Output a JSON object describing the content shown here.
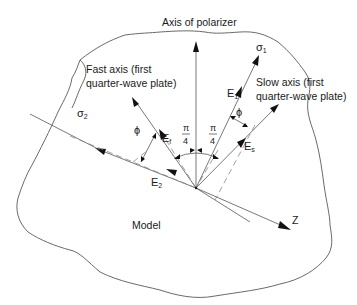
{
  "diagram": {
    "labels": {
      "polarizer_axis": "Axis of polarizer",
      "fast_axis_line1": "Fast axis (first",
      "fast_axis_line2": "quarter-wave plate)",
      "slow_axis_line1": "Slow axis (first",
      "slow_axis_line2": "quarter-wave plate)",
      "model": "Model",
      "z_axis": "Z"
    },
    "symbols": {
      "sigma1": "σ",
      "sigma1_sub": "1",
      "sigma2": "σ",
      "sigma2_sub": "2",
      "E1": "E",
      "E1_sub": "1",
      "E2": "E",
      "E2_sub": "2",
      "Ef": "E",
      "Ef_sub": "f",
      "Es": "E",
      "Es_sub": "s",
      "phi_left": "ϕ",
      "phi_right": "ϕ",
      "pi_left_num": "π",
      "pi_left_den": "4",
      "pi_right_num": "π",
      "pi_right_den": "4"
    },
    "colors": {
      "line": "#555555",
      "dashed": "#888888",
      "arrowhead": "#111111",
      "text": "#1a1a1a"
    }
  }
}
